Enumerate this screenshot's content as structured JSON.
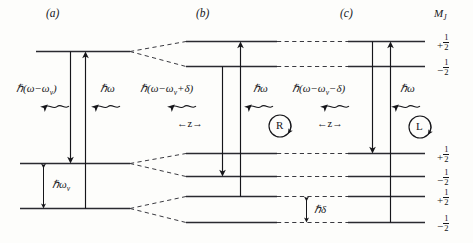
{
  "figure": {
    "panels": [
      {
        "id": "a",
        "label": "(a)"
      },
      {
        "id": "b",
        "label": "(b)"
      },
      {
        "id": "c",
        "label": "(c)"
      }
    ],
    "column_header": "M",
    "column_header_sub": "J",
    "energy_labels": {
      "panel_a_emitted": "ℏ(ω−ω",
      "panel_a_emitted_sub": "v",
      "panel_a_emitted_tail": ")",
      "panel_a_absorbed": "ℏω",
      "panel_b_emitted_head": "ℏ(ω−ω",
      "panel_b_emitted_sub": "v",
      "panel_b_emitted_tail": "+δ)",
      "panel_b_absorbed": "ℏω",
      "panel_c_emitted_head": "ℏ(ω−ω",
      "panel_c_emitted_sub": "v",
      "panel_c_emitted_tail": "−δ)",
      "panel_c_absorbed": "ℏω",
      "vibrational_splitting": "ℏω",
      "vibrational_splitting_sub": "v",
      "zeeman_splitting": "ℏδ"
    },
    "polarization_markers": [
      {
        "id": "R",
        "label": "R"
      },
      {
        "id": "L",
        "label": "L"
      }
    ],
    "direction_labels": [
      {
        "id": "b-z",
        "label": "←z→"
      },
      {
        "id": "c-z",
        "label": "←z→"
      }
    ],
    "mj_values": [
      {
        "sign": "+",
        "num": "1",
        "den": "2"
      },
      {
        "sign": "−",
        "num": "1",
        "den": "2"
      },
      {
        "sign": "+",
        "num": "1",
        "den": "2"
      },
      {
        "sign": "−",
        "num": "1",
        "den": "2"
      },
      {
        "sign": "+",
        "num": "1",
        "den": "2"
      },
      {
        "sign": "−",
        "num": "1",
        "den": "2"
      }
    ],
    "colors": {
      "ink": "#16161a",
      "level_line": "#2a2a30",
      "dashed": "#3a3a40",
      "background": "#fdfdfb"
    }
  }
}
